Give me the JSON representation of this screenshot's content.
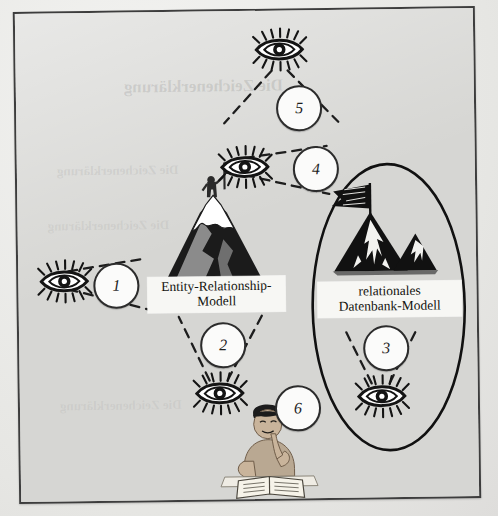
{
  "figure": {
    "title_none": "",
    "background_color": "#d6d6d3",
    "frame_color": "#3d3d3d",
    "ghost_text": "Die Zeichenerklärung",
    "labels": [
      {
        "id": "er-model",
        "line1": "Entity-Relationship-",
        "line2": "Modell"
      },
      {
        "id": "relational-db-model",
        "line1": "relationales",
        "line2": "Datenbank-Modell"
      }
    ],
    "numbered_markers": [
      {
        "id": "marker-1",
        "number": "1"
      },
      {
        "id": "marker-2",
        "number": "2"
      },
      {
        "id": "marker-3",
        "number": "3"
      },
      {
        "id": "marker-4",
        "number": "4"
      },
      {
        "id": "marker-5",
        "number": "5"
      },
      {
        "id": "marker-6",
        "number": "6"
      }
    ],
    "eyes": [
      {
        "id": "eye-1",
        "direction": "right"
      },
      {
        "id": "eye-2",
        "direction": "up"
      },
      {
        "id": "eye-3",
        "direction": "up"
      },
      {
        "id": "eye-4",
        "direction": "right"
      },
      {
        "id": "eye-5",
        "direction": "down"
      }
    ],
    "illustrations": [
      {
        "id": "mountain-with-climber",
        "description": "snow-capped mountain with a person planting a flag on the summit"
      },
      {
        "id": "mountain-with-flag-lineart",
        "description": "line-art mountain range with a flag, enclosed in an ellipse"
      },
      {
        "id": "student-reading",
        "description": "young student at a desk reading an open book, hand on chin"
      }
    ],
    "shapes": [
      {
        "id": "boundary-ellipse",
        "description": "large vertical ellipse enclosing the relational database model"
      }
    ]
  }
}
